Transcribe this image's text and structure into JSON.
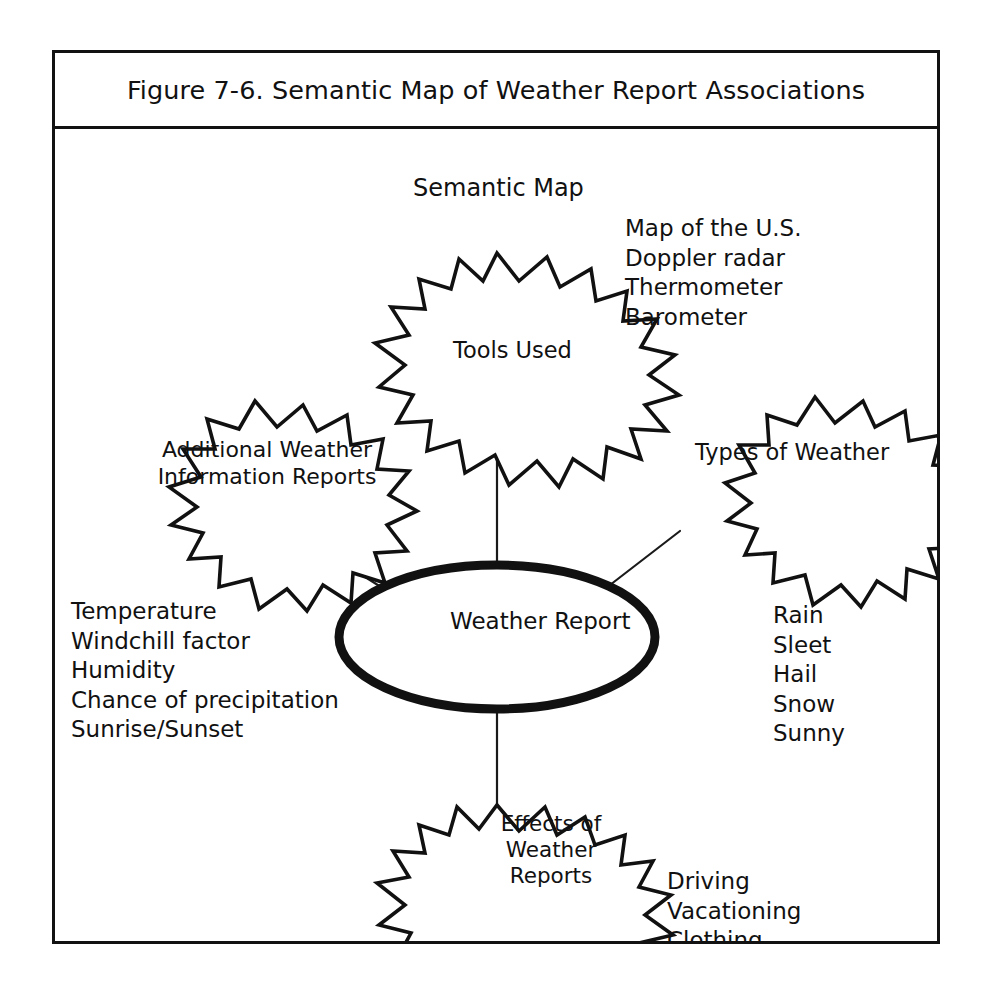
{
  "figure": {
    "caption": "Figure 7-6. Semantic Map of Weather Report Associations",
    "heading": "Semantic Map",
    "frame_color": "#121212",
    "background_color": "#ffffff"
  },
  "center_node": {
    "label": "Weather Report",
    "shape": "ellipse",
    "stroke_color": "#111111"
  },
  "nodes": [
    {
      "id": "tools-used",
      "label": "Tools Used",
      "shape": "starburst",
      "position": "top",
      "items": [
        "Map of the U.S.",
        "Doppler radar",
        "Thermometer",
        "Barometer"
      ]
    },
    {
      "id": "additional-weather-information-reports",
      "label": "Additional Weather Information Reports",
      "label_line_1": "Additional Weather",
      "label_line_2": "Information Reports",
      "shape": "starburst",
      "position": "left",
      "items": [
        "Temperature",
        "Windchill factor",
        "Humidity",
        "Chance of precipitation",
        "Sunrise/Sunset"
      ]
    },
    {
      "id": "types-of-weather",
      "label": "Types of Weather",
      "shape": "starburst",
      "position": "right",
      "items": [
        "Rain",
        "Sleet",
        "Hail",
        "Snow",
        "Sunny"
      ]
    },
    {
      "id": "effects-of-weather-reports",
      "label": "Effects of Weather Reports",
      "label_line_1": "Effects of",
      "label_line_2": "Weather",
      "label_line_3": "Reports",
      "shape": "starburst",
      "position": "bottom",
      "items": [
        "Driving",
        "Vacationing",
        "Clothing"
      ]
    }
  ],
  "connectors": [
    {
      "from": "center_node",
      "to": "tools-used"
    },
    {
      "from": "center_node",
      "to": "additional-weather-information-reports"
    },
    {
      "from": "center_node",
      "to": "types-of-weather"
    },
    {
      "from": "center_node",
      "to": "effects-of-weather-reports"
    }
  ]
}
